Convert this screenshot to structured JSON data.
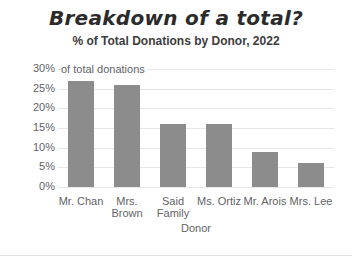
{
  "figure": {
    "background": "#ffffff",
    "border_bottom_color": "#e3e3e3"
  },
  "chart_data": {
    "type": "bar",
    "title": "Breakdown of a total?",
    "subtitle": "% of Total Donations by Donor, 2022",
    "categories": [
      "Mr. Chan",
      "Mrs. Brown",
      "Said Family",
      "Ms. Ortiz",
      "Mr. Arois",
      "Mrs. Lee"
    ],
    "values": [
      27,
      26,
      16,
      16,
      9,
      6
    ],
    "xlabel": "Donor",
    "ylabel": "of total donations",
    "ylim": [
      0,
      30
    ],
    "yticks": [
      0,
      5,
      10,
      15,
      20,
      25,
      30
    ],
    "ytick_suffix": "%",
    "grid": true,
    "legend": false,
    "bar_color": "#8c8c8c",
    "grid_color": "#e7e7e7",
    "axis_text_color": "#5f6368",
    "title_color": "#2b2b2b",
    "subtitle_color": "#3d3d3d"
  }
}
